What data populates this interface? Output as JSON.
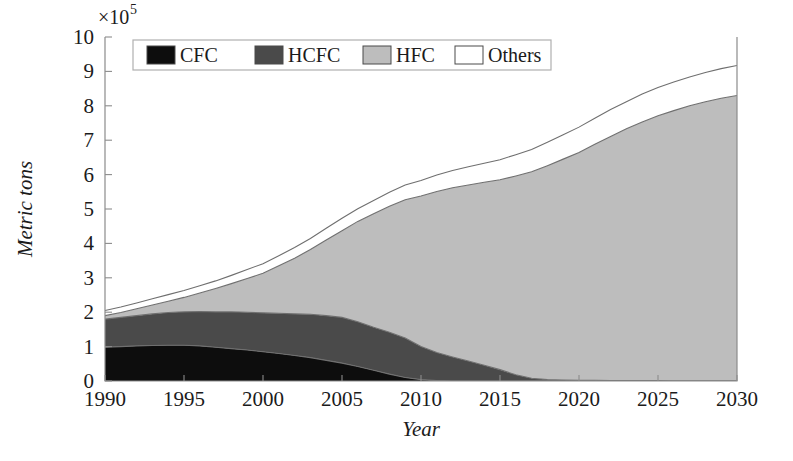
{
  "chart_data": {
    "type": "area",
    "stacked": true,
    "title": "",
    "xlabel": "Year",
    "ylabel": "Metric tons",
    "y_multiplier": "×10⁵",
    "y_multiplier_base": "×10",
    "y_multiplier_exp": "5",
    "xlim": [
      1990,
      2030
    ],
    "ylim": [
      0,
      10
    ],
    "xticks": [
      1990,
      1995,
      2000,
      2005,
      2010,
      2015,
      2020,
      2025,
      2030
    ],
    "xticklabels": [
      "1990",
      "1995",
      "2000",
      "2005",
      "2010",
      "2015",
      "2020",
      "2025",
      "2030"
    ],
    "yticks": [
      0,
      1,
      2,
      3,
      4,
      5,
      6,
      7,
      8,
      9,
      10
    ],
    "yticklabels": [
      "0",
      "1",
      "2",
      "3",
      "4",
      "5",
      "6",
      "7",
      "8",
      "9",
      "10"
    ],
    "grid": false,
    "legend_position": "top-inside",
    "x": [
      1990,
      1991,
      1992,
      1993,
      1994,
      1995,
      1996,
      1997,
      1998,
      1999,
      2000,
      2001,
      2002,
      2003,
      2004,
      2005,
      2006,
      2007,
      2008,
      2009,
      2010,
      2011,
      2012,
      2013,
      2014,
      2015,
      2016,
      2017,
      2018,
      2019,
      2020,
      2021,
      2022,
      2023,
      2024,
      2025,
      2026,
      2027,
      2028,
      2029,
      2030
    ],
    "series": [
      {
        "name": "CFC",
        "color": "#0d0d0d",
        "values": [
          0.98,
          1.0,
          1.02,
          1.03,
          1.04,
          1.04,
          1.02,
          0.98,
          0.94,
          0.9,
          0.85,
          0.8,
          0.74,
          0.68,
          0.6,
          0.52,
          0.42,
          0.31,
          0.2,
          0.1,
          0.04,
          0.01,
          0.0,
          0.0,
          0.0,
          0.0,
          0.0,
          0.0,
          0.0,
          0.0,
          0.0,
          0.0,
          0.0,
          0.0,
          0.0,
          0.0,
          0.0,
          0.0,
          0.0,
          0.0,
          0.0
        ]
      },
      {
        "name": "HCFC",
        "color": "#4a4a4a",
        "values": [
          0.82,
          0.85,
          0.88,
          0.92,
          0.95,
          0.97,
          1.0,
          1.03,
          1.07,
          1.1,
          1.13,
          1.17,
          1.21,
          1.26,
          1.3,
          1.33,
          1.3,
          1.25,
          1.22,
          1.15,
          0.96,
          0.82,
          0.7,
          0.58,
          0.46,
          0.33,
          0.18,
          0.08,
          0.04,
          0.03,
          0.02,
          0.02,
          0.01,
          0.01,
          0.01,
          0.01,
          0.0,
          0.0,
          0.0,
          0.0,
          0.0
        ]
      },
      {
        "name": "HFC",
        "color": "#bdbdbd",
        "values": [
          0.1,
          0.14,
          0.2,
          0.26,
          0.33,
          0.42,
          0.54,
          0.68,
          0.82,
          0.98,
          1.15,
          1.38,
          1.62,
          1.88,
          2.2,
          2.52,
          2.92,
          3.3,
          3.66,
          4.02,
          4.38,
          4.68,
          4.92,
          5.12,
          5.32,
          5.52,
          5.78,
          6.0,
          6.22,
          6.42,
          6.62,
          6.86,
          7.1,
          7.32,
          7.52,
          7.7,
          7.86,
          8.0,
          8.12,
          8.22,
          8.3
        ]
      },
      {
        "name": "Others",
        "color": "#ffffff",
        "values": [
          0.15,
          0.16,
          0.17,
          0.18,
          0.19,
          0.2,
          0.21,
          0.22,
          0.24,
          0.26,
          0.28,
          0.29,
          0.31,
          0.32,
          0.34,
          0.36,
          0.37,
          0.39,
          0.41,
          0.43,
          0.45,
          0.48,
          0.5,
          0.53,
          0.55,
          0.58,
          0.62,
          0.65,
          0.68,
          0.71,
          0.74,
          0.76,
          0.78,
          0.79,
          0.81,
          0.82,
          0.83,
          0.84,
          0.85,
          0.86,
          0.87
        ]
      }
    ],
    "totals": [
      2.05,
      2.15,
      2.27,
      2.39,
      2.51,
      2.63,
      2.77,
      2.91,
      3.07,
      3.24,
      3.41,
      3.64,
      3.88,
      4.14,
      4.44,
      4.73,
      5.01,
      5.25,
      5.49,
      5.7,
      5.83,
      5.99,
      6.12,
      6.23,
      6.33,
      6.43,
      6.58,
      6.73,
      6.94,
      7.16,
      7.38,
      7.64,
      7.89,
      8.12,
      8.34,
      8.53,
      8.69,
      8.84,
      8.97,
      9.08,
      9.17
    ]
  },
  "legend": {
    "entries": [
      {
        "label": "CFC",
        "color": "#0d0d0d"
      },
      {
        "label": "HCFC",
        "color": "#4a4a4a"
      },
      {
        "label": "HFC",
        "color": "#bdbdbd"
      },
      {
        "label": "Others",
        "color": "#ffffff"
      }
    ]
  }
}
